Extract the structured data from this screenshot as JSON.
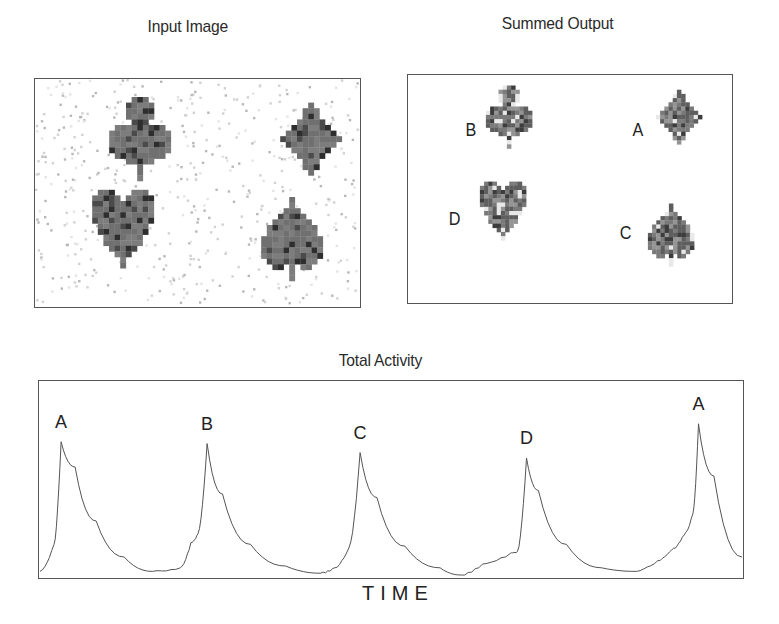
{
  "panels": {
    "input": {
      "title": "Input Image",
      "shapes": [
        {
          "suit": "club",
          "cx": 105,
          "cy": 60
        },
        {
          "suit": "diamond",
          "cx": 276,
          "cy": 60
        },
        {
          "suit": "heart",
          "cx": 88,
          "cy": 150
        },
        {
          "suit": "spade",
          "cx": 257,
          "cy": 160
        }
      ]
    },
    "output": {
      "title": "Summed Output",
      "items": [
        {
          "label": "B",
          "suit": "club"
        },
        {
          "label": "A",
          "suit": "diamond"
        },
        {
          "label": "D",
          "suit": "heart"
        },
        {
          "label": "C",
          "suit": "spade"
        }
      ]
    }
  },
  "colors": {
    "shape_fill": "#6e6e6e",
    "shape_dark": "#3a3a3a",
    "line": "#555555",
    "frame": "#555555"
  },
  "chart_data": {
    "type": "line",
    "title": "Total Activity",
    "xlabel": "TIME",
    "ylabel": "",
    "grid": false,
    "legend": null,
    "peaks": [
      {
        "label": "A",
        "x": 0.03,
        "y": 0.74
      },
      {
        "label": "B",
        "x": 0.238,
        "y": 0.73
      },
      {
        "label": "C",
        "x": 0.456,
        "y": 0.68
      },
      {
        "label": "D",
        "x": 0.693,
        "y": 0.65
      },
      {
        "label": "A",
        "x": 0.938,
        "y": 0.84
      }
    ],
    "x": [
      0.0,
      0.02,
      0.03,
      0.05,
      0.08,
      0.12,
      0.16,
      0.2,
      0.215,
      0.225,
      0.238,
      0.26,
      0.3,
      0.35,
      0.4,
      0.42,
      0.44,
      0.456,
      0.48,
      0.52,
      0.57,
      0.6,
      0.63,
      0.67,
      0.68,
      0.693,
      0.71,
      0.75,
      0.8,
      0.85,
      0.88,
      0.9,
      0.915,
      0.93,
      0.938,
      0.96,
      1.0
    ],
    "y": [
      0.02,
      0.17,
      0.74,
      0.6,
      0.3,
      0.1,
      0.02,
      0.04,
      0.18,
      0.23,
      0.73,
      0.45,
      0.17,
      0.05,
      0.01,
      0.04,
      0.15,
      0.68,
      0.43,
      0.16,
      0.04,
      0.0,
      0.06,
      0.12,
      0.13,
      0.65,
      0.47,
      0.17,
      0.04,
      0.02,
      0.08,
      0.14,
      0.21,
      0.34,
      0.84,
      0.55,
      0.1
    ],
    "ylim": [
      0,
      1
    ],
    "xlim": [
      0,
      1
    ]
  }
}
